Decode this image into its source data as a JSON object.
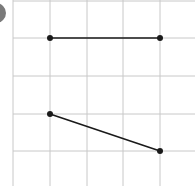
{
  "diagram": {
    "grid": {
      "color": "#c8c8c8",
      "vertical_lines_x": [
        13,
        50,
        87,
        123,
        160
      ],
      "horizontal_lines_y": [
        1,
        38,
        76,
        114,
        151
      ]
    },
    "segments": [
      {
        "name": "horizontal-segment",
        "x1": 50,
        "y1": 38,
        "x2": 160,
        "y2": 38
      },
      {
        "name": "slanted-segment",
        "x1": 50,
        "y1": 114,
        "x2": 160,
        "y2": 151
      }
    ],
    "points": [
      {
        "x": 50,
        "y": 38
      },
      {
        "x": 160,
        "y": 38
      },
      {
        "x": 50,
        "y": 114
      },
      {
        "x": 160,
        "y": 151
      }
    ],
    "stroke_color": "#1a1a1a",
    "label_badge_color": "#7a7a7a"
  }
}
